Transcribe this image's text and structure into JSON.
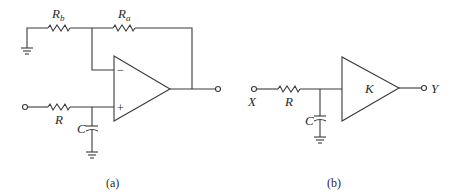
{
  "figure": {
    "panel_a": {
      "caption": "(a)",
      "components": {
        "rb_main": "R",
        "rb_sub": "b",
        "ra_main": "R",
        "ra_sub": "a",
        "input_resistor": "R",
        "capacitor": "C",
        "minus_sign": "−",
        "plus_sign": "+"
      }
    },
    "panel_b": {
      "caption": "(b)",
      "components": {
        "input_label": "X",
        "output_label": "Y",
        "resistor": "R",
        "capacitor": "C",
        "amplifier_gain": "K"
      }
    }
  }
}
